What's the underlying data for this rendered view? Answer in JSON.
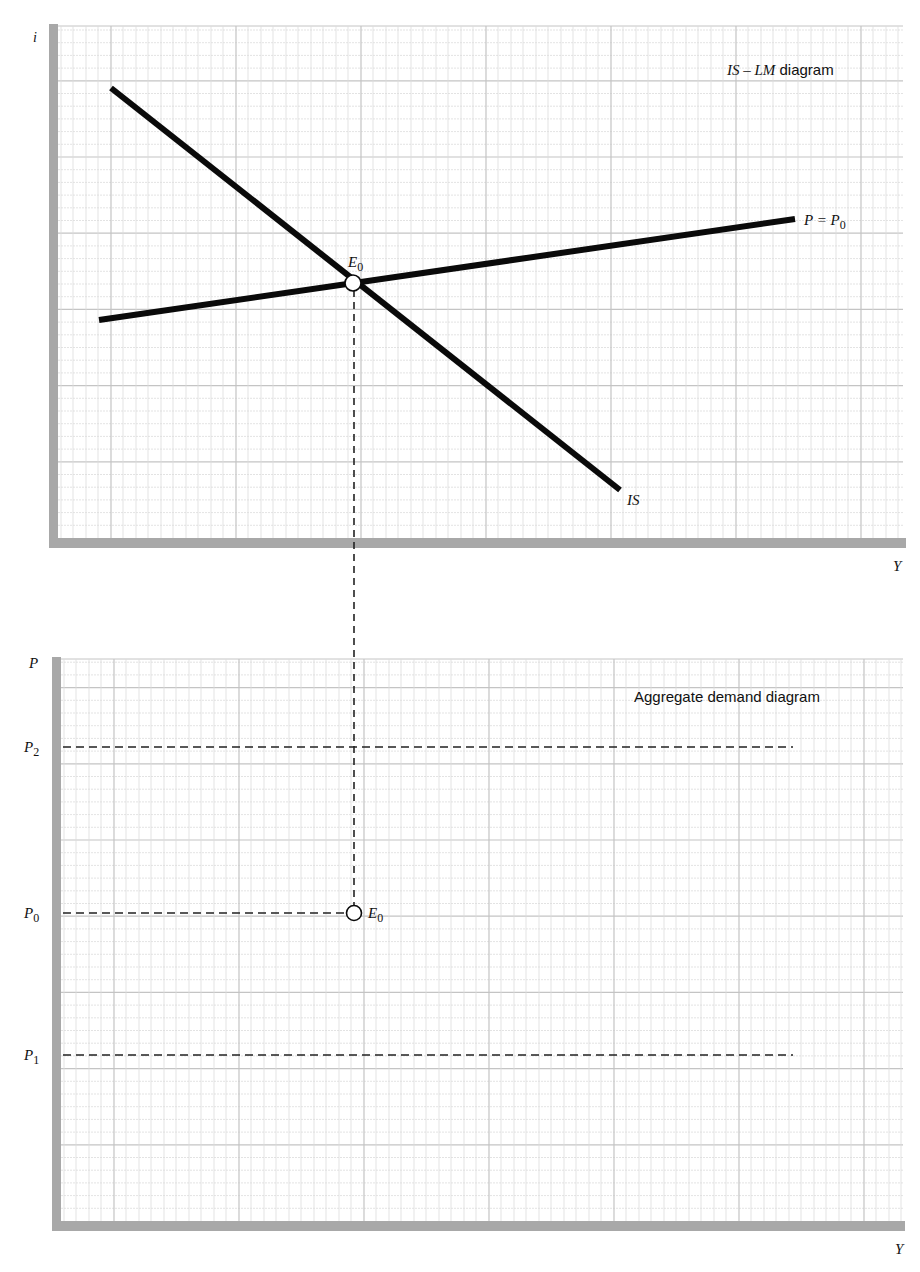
{
  "top_panel": {
    "title_italic": "IS – LM",
    "title_rest": " diagram",
    "y_axis_label": "i",
    "x_axis_label": "Y",
    "lm_label_left": "P = P",
    "lm_label_sub": "0",
    "is_label": "IS",
    "point_label": "E",
    "point_sub": "0"
  },
  "bottom_panel": {
    "title": "Aggregate demand diagram",
    "y_axis_label": "P",
    "x_axis_label": "Y",
    "levels": [
      {
        "label": "P",
        "sub": "2",
        "y": 747,
        "x_end": 793
      },
      {
        "label": "P",
        "sub": "0",
        "y": 913,
        "x_end": 347
      },
      {
        "label": "P",
        "sub": "1",
        "y": 1055,
        "x_end": 793
      }
    ],
    "point_label": "E",
    "point_sub": "0"
  },
  "chart_data": [
    {
      "type": "line",
      "title": "IS – LM diagram",
      "xlabel": "Y",
      "ylabel": "i",
      "grid": true,
      "series": [
        {
          "name": "IS",
          "points": [
            [
              111,
              88
            ],
            [
              620,
              490
            ]
          ],
          "slope": "negative"
        },
        {
          "name": "LM (P = P0)",
          "points": [
            [
              99,
              320
            ],
            [
              795,
              219
            ]
          ],
          "slope": "positive"
        }
      ],
      "annotations": [
        {
          "label": "E0",
          "at": [
            353,
            283
          ],
          "meaning": "IS–LM equilibrium"
        }
      ]
    },
    {
      "type": "line",
      "title": "Aggregate demand diagram",
      "xlabel": "Y",
      "ylabel": "P",
      "grid": true,
      "series": [
        {
          "name": "P2",
          "style": "dashed-horizontal",
          "level": "high"
        },
        {
          "name": "P0",
          "style": "dashed-horizontal",
          "level": "middle"
        },
        {
          "name": "P1",
          "style": "dashed-horizontal",
          "level": "low"
        }
      ],
      "annotations": [
        {
          "label": "E0",
          "at": [
            353,
            913
          ],
          "meaning": "output at P0 from IS–LM equilibrium"
        }
      ]
    }
  ],
  "colors": {
    "axis": "#a8a8a8",
    "grid_light": "#dcdcdc",
    "grid_heavy": "#c4c4c4",
    "curve": "#0a0a0a",
    "dash": "#222222"
  }
}
